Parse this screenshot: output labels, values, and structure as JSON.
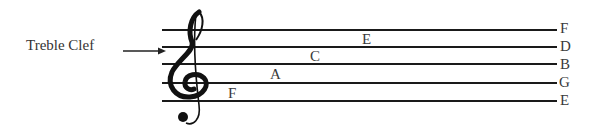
{
  "diagram": {
    "title": "Treble Clef",
    "clef_icon": "treble-clef-icon",
    "line_notes": [
      "F",
      "D",
      "B",
      "G",
      "E"
    ],
    "space_notes": [
      "E",
      "C",
      "A",
      "F"
    ],
    "colors": {
      "ink": "#1a1a1a",
      "text": "#333333"
    }
  }
}
